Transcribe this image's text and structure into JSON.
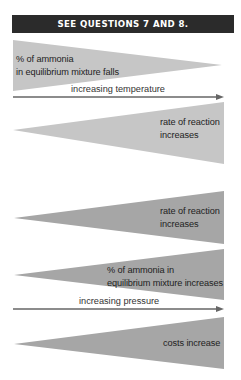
{
  "header": {
    "title": "SEE QUESTIONS 7 AND 8."
  },
  "colors": {
    "header_bg": "#2b2b2b",
    "header_text": "#ffffff",
    "temperature_wedge": "#c6c6c6",
    "pressure_wedge": "#a6a6a6",
    "arrow": "#666666"
  },
  "temperature_section": {
    "wedges": [
      {
        "label_line1": "% of ammonia",
        "label_line2": "in equilibrium mixture falls",
        "direction": "decreasing"
      },
      {
        "label_line1": "rate of reaction",
        "label_line2": "increases",
        "direction": "increasing"
      }
    ],
    "axis": {
      "label": "increasing temperature",
      "icon": "arrow-right-icon"
    }
  },
  "pressure_section": {
    "wedges": [
      {
        "label_line1": "rate of reaction",
        "label_line2": "increases",
        "direction": "increasing"
      },
      {
        "label_line1": "% of ammonia in",
        "label_line2": "equilibrium mixture increases",
        "direction": "increasing"
      },
      {
        "label_line1": "costs increase",
        "direction": "increasing"
      }
    ],
    "axis": {
      "label": "increasing pressure",
      "icon": "arrow-right-icon"
    }
  }
}
